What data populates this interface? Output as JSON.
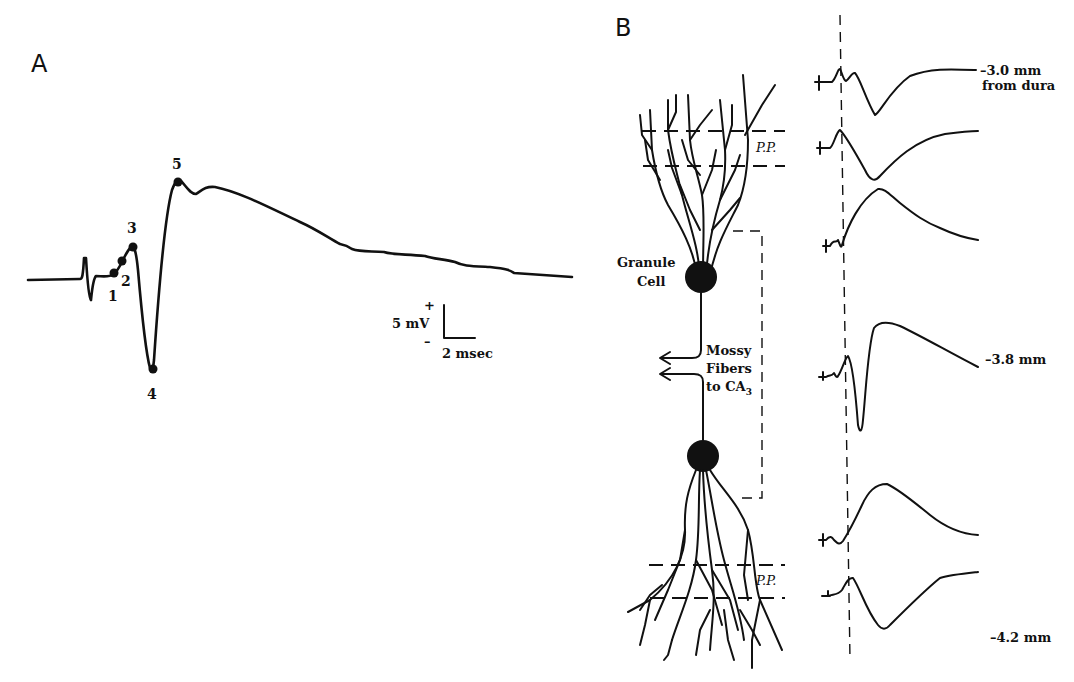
{
  "figure": {
    "panel_a": {
      "letter": "A",
      "points": [
        "1",
        "2",
        "3",
        "4",
        "5"
      ],
      "scale_bar": {
        "plus": "+",
        "minus": "–",
        "voltage": "5 mV",
        "time": "2 msec"
      }
    },
    "panel_b": {
      "letter": "B",
      "cell_label_line1": "Granule",
      "cell_label_line2": "Cell",
      "axon_label_line1": "Mossy",
      "axon_label_line2": "Fibers",
      "axon_label_line3": "to CA",
      "axon_label_sub": "3",
      "pp_top": "P.P.",
      "pp_bottom": "P.P.",
      "depth_top_line1": "–3.0 mm",
      "depth_top_line2": "from dura",
      "depth_mid": "–3.8 mm",
      "depth_bottom": "–4.2 mm"
    }
  }
}
